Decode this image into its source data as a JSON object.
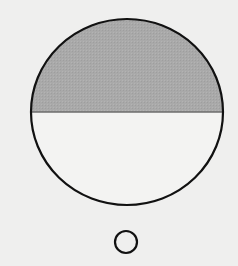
{
  "diagram": {
    "big_circle": {
      "cx": 127,
      "cy": 112,
      "rx": 96,
      "ry": 93,
      "stroke": "#111111",
      "stroke_width": 2.2
    },
    "diameter_line": {
      "y": 112,
      "stroke": "#6e6e6e"
    },
    "shaded_region": {
      "half": "upper",
      "fill": "#a9a9a9"
    },
    "unshaded_region": {
      "half": "lower",
      "fill": "#f3f3f2"
    },
    "small_circle": {
      "label": "O",
      "cx": 126,
      "cy": 242,
      "r": 11,
      "stroke": "#111111"
    },
    "colors": {
      "background": "#efefee",
      "shade": "#a9a9a9",
      "outline": "#111111"
    }
  }
}
